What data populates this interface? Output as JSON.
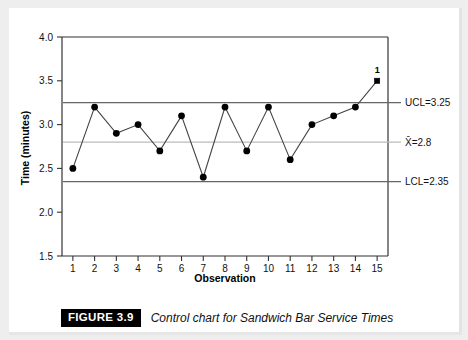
{
  "figure": {
    "badge": "FIGURE 3.9",
    "caption": "Control chart for Sandwich Bar Service Times"
  },
  "chart_data": {
    "type": "line",
    "title": "",
    "xlabel": "Observation",
    "ylabel": "Time (minutes)",
    "x": [
      1,
      2,
      3,
      4,
      5,
      6,
      7,
      8,
      9,
      10,
      11,
      12,
      13,
      14,
      15
    ],
    "values": [
      2.5,
      3.2,
      2.9,
      3.0,
      2.7,
      3.1,
      2.4,
      3.2,
      2.7,
      3.2,
      2.6,
      3.0,
      3.1,
      3.2,
      3.5
    ],
    "xlim": [
      0.5,
      15.5
    ],
    "ylim": [
      1.5,
      4.0
    ],
    "xticks": [
      "1",
      "2",
      "3",
      "4",
      "5",
      "6",
      "7",
      "8",
      "9",
      "10",
      "11",
      "12",
      "13",
      "14",
      "15"
    ],
    "yticks": [
      "1.5",
      "2.0",
      "2.5",
      "3.0",
      "3.5",
      "4.0"
    ],
    "ytick_values": [
      1.5,
      2.0,
      2.5,
      3.0,
      3.5,
      4.0
    ],
    "grid": false,
    "legend": "none",
    "control_limits": [
      {
        "name": "UCL",
        "label": "UCL=3.25",
        "value": 3.25,
        "color": "#666666"
      },
      {
        "name": "CL",
        "label": "X̅0=2.8",
        "value": 2.8,
        "color": "#bbbbbb"
      },
      {
        "name": "LCL",
        "label": "LCL=2.35",
        "value": 2.35,
        "color": "#666666"
      }
    ],
    "center_line_label": "X̄=2.8",
    "ucl_label": "UCL=3.25",
    "lcl_label": "LCL=2.35",
    "annotations": [
      {
        "text": "1",
        "x": 15,
        "y": 3.5,
        "note": "out-of-control point flag"
      }
    ],
    "out_of_control_points": [
      15
    ],
    "marker_color": "#000000",
    "line_color": "#444444"
  }
}
